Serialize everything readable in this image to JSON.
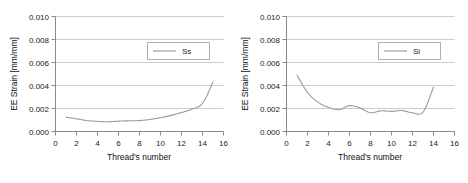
{
  "figure": {
    "background_color": "#ffffff",
    "panel_count": 2
  },
  "chart_data": [
    {
      "type": "line",
      "title": "",
      "xlabel": "Thread's number",
      "ylabel": "EE Strain [mm/mm]",
      "xlim": [
        0,
        16
      ],
      "ylim": [
        0,
        0.01
      ],
      "xticks": [
        0,
        2,
        4,
        6,
        8,
        10,
        12,
        14,
        16
      ],
      "xtick_labels": [
        "0",
        "2",
        "4",
        "6",
        "8",
        "10",
        "12",
        "14",
        "16"
      ],
      "yticks": [
        0.0,
        0.002,
        0.004,
        0.006,
        0.008,
        0.01
      ],
      "ytick_labels": [
        "0.000",
        "0.002",
        "0.004",
        "0.006",
        "0.008",
        "0.010"
      ],
      "grid": "horizontal",
      "grid_color": "#cccccc",
      "axis_color": "#8a8a8a",
      "line_color": "#9a9a9a",
      "legend": {
        "entries": [
          "Ss"
        ],
        "position": "upper-right",
        "border_color": "#b0b0b0"
      },
      "series": [
        {
          "name": "Ss",
          "x": [
            1,
            2,
            3,
            4,
            5,
            6,
            7,
            8,
            9,
            10,
            11,
            12,
            13,
            14,
            15
          ],
          "values": [
            0.00125,
            0.0011,
            0.00095,
            0.00088,
            0.00085,
            0.0009,
            0.00093,
            0.00095,
            0.00105,
            0.0012,
            0.0014,
            0.00165,
            0.00195,
            0.00245,
            0.0043
          ]
        }
      ]
    },
    {
      "type": "line",
      "title": "",
      "xlabel": "Thread's number",
      "ylabel": "EE Strain [mm/mm]",
      "xlim": [
        0,
        16
      ],
      "ylim": [
        0,
        0.01
      ],
      "xticks": [
        0,
        2,
        4,
        6,
        8,
        10,
        12,
        14,
        16
      ],
      "xtick_labels": [
        "0",
        "2",
        "4",
        "6",
        "8",
        "10",
        "12",
        "14",
        "16"
      ],
      "yticks": [
        0.0,
        0.002,
        0.004,
        0.006,
        0.008,
        0.01
      ],
      "ytick_labels": [
        "0.000",
        "0.002",
        "0.004",
        "0.006",
        "0.008",
        "0.010"
      ],
      "grid": "horizontal",
      "grid_color": "#cccccc",
      "axis_color": "#8a8a8a",
      "line_color": "#9a9a9a",
      "legend": {
        "entries": [
          "Si"
        ],
        "position": "upper-right",
        "border_color": "#b0b0b0"
      },
      "series": [
        {
          "name": "Si",
          "x": [
            1,
            2,
            3,
            4,
            5,
            6,
            7,
            8,
            9,
            10,
            11,
            12,
            13,
            14
          ],
          "values": [
            0.0049,
            0.0034,
            0.00255,
            0.0021,
            0.0019,
            0.00225,
            0.00205,
            0.00163,
            0.0018,
            0.00175,
            0.00182,
            0.00163,
            0.00168,
            0.00385
          ]
        }
      ]
    }
  ]
}
